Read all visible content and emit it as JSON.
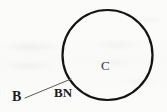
{
  "figure": {
    "kind": "geometric-diagram",
    "canvas": {
      "width": 167,
      "height": 112
    },
    "background_color": "#fbfbfa",
    "ink_color": "#1b1b1b",
    "shapes": {
      "circle": {
        "name": "circle-C",
        "center_x": 107.5,
        "center_y": 55,
        "radius": 45,
        "stroke_color": "#141414",
        "stroke_width": 2.2,
        "fill": "none"
      },
      "leader_line": {
        "name": "leader-line-B-to-circle",
        "x1": 25,
        "y1": 98,
        "x2": 71,
        "y2": 79,
        "stroke_color": "#5a5a5a",
        "stroke_width": 1
      }
    },
    "labels": [
      {
        "id": "C",
        "text": "C",
        "role": "circle-interior-label",
        "x": 107,
        "y": 66
      },
      {
        "id": "B",
        "text": "B",
        "role": "point-label",
        "x": 17,
        "y": 97
      },
      {
        "id": "BN",
        "text": "BN",
        "role": "segment-label",
        "x": 63,
        "y": 93
      }
    ]
  }
}
